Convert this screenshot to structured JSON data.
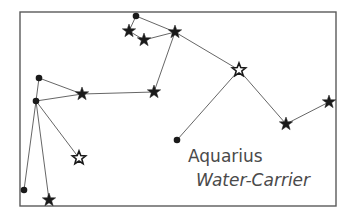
{
  "title": "Aquarius",
  "subtitle": "Water-Carrier",
  "colors": {
    "frame": "#5a5a5a",
    "line": "#555555",
    "star": "#1a1a1a",
    "text": "#4a4a4a"
  },
  "frame": {
    "x": 20,
    "y": 12,
    "width": 316,
    "height": 194
  },
  "stars": [
    {
      "id": "s1",
      "x": 136,
      "y": 16,
      "type": "dot"
    },
    {
      "id": "s2",
      "x": 129,
      "y": 31,
      "type": "star"
    },
    {
      "id": "s3",
      "x": 144,
      "y": 40,
      "type": "star"
    },
    {
      "id": "s4",
      "x": 175,
      "y": 32,
      "type": "star"
    },
    {
      "id": "s5",
      "x": 154,
      "y": 92,
      "type": "star"
    },
    {
      "id": "s6",
      "x": 82,
      "y": 94,
      "type": "star"
    },
    {
      "id": "s7",
      "x": 39,
      "y": 78,
      "type": "dot"
    },
    {
      "id": "s8",
      "x": 36,
      "y": 101,
      "type": "dot"
    },
    {
      "id": "s9",
      "x": 239,
      "y": 70,
      "type": "hollow"
    },
    {
      "id": "s10",
      "x": 177,
      "y": 140,
      "type": "dot"
    },
    {
      "id": "s11",
      "x": 286,
      "y": 124,
      "type": "star"
    },
    {
      "id": "s12",
      "x": 329,
      "y": 102,
      "type": "star"
    },
    {
      "id": "s13",
      "x": 79,
      "y": 158,
      "type": "hollow"
    },
    {
      "id": "s14",
      "x": 24,
      "y": 190,
      "type": "dot"
    },
    {
      "id": "s15",
      "x": 49,
      "y": 200,
      "type": "star"
    }
  ],
  "edges": [
    [
      "s1",
      "s2"
    ],
    [
      "s2",
      "s3"
    ],
    [
      "s3",
      "s4"
    ],
    [
      "s1",
      "s4"
    ],
    [
      "s4",
      "s5"
    ],
    [
      "s5",
      "s6"
    ],
    [
      "s6",
      "s7"
    ],
    [
      "s6",
      "s8"
    ],
    [
      "s7",
      "s8"
    ],
    [
      "s4",
      "s9"
    ],
    [
      "s9",
      "s10"
    ],
    [
      "s9",
      "s11"
    ],
    [
      "s11",
      "s12"
    ],
    [
      "s8",
      "s13"
    ],
    [
      "s8",
      "s14"
    ],
    [
      "s8",
      "s15"
    ]
  ],
  "labels": {
    "name": {
      "text": "Aquarius",
      "x": 188,
      "y": 162
    },
    "sub": {
      "text": "Water-Carrier",
      "x": 196,
      "y": 186
    }
  }
}
